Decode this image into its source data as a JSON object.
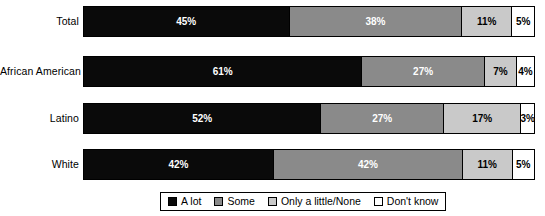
{
  "chart_data": {
    "type": "bar",
    "subtype": "stacked-horizontal-100pct",
    "title": "",
    "xlabel": "",
    "ylabel": "",
    "xlim": [
      0,
      100
    ],
    "grid": false,
    "legend_position": "bottom",
    "categories": [
      "Total",
      "African American",
      "Latino",
      "White"
    ],
    "series": [
      {
        "name": "A lot",
        "color": "#0a0a0a",
        "values": [
          45,
          61,
          52,
          42
        ]
      },
      {
        "name": "Some",
        "color": "#8a8a8a",
        "values": [
          38,
          27,
          27,
          42
        ]
      },
      {
        "name": "Only a little/None",
        "color": "#c9c9c9",
        "values": [
          11,
          7,
          17,
          11
        ]
      },
      {
        "name": "Don't know",
        "color": "#ffffff",
        "values": [
          5,
          4,
          3,
          5
        ]
      }
    ]
  },
  "rows": [
    {
      "label": "Total",
      "segments": [
        {
          "key": "alot",
          "label": "45%",
          "value": 45
        },
        {
          "key": "some",
          "label": "38%",
          "value": 38
        },
        {
          "key": "little",
          "label": "11%",
          "value": 11
        },
        {
          "key": "dk",
          "label": "5%",
          "value": 5
        }
      ]
    },
    {
      "label": "African American",
      "segments": [
        {
          "key": "alot",
          "label": "61%",
          "value": 61
        },
        {
          "key": "some",
          "label": "27%",
          "value": 27
        },
        {
          "key": "little",
          "label": "7%",
          "value": 7
        },
        {
          "key": "dk",
          "label": "4%",
          "value": 4
        }
      ]
    },
    {
      "label": "Latino",
      "segments": [
        {
          "key": "alot",
          "label": "52%",
          "value": 52
        },
        {
          "key": "some",
          "label": "27%",
          "value": 27
        },
        {
          "key": "little",
          "label": "17%",
          "value": 17
        },
        {
          "key": "dk",
          "label": "3%",
          "value": 3
        }
      ]
    },
    {
      "label": "White",
      "segments": [
        {
          "key": "alot",
          "label": "42%",
          "value": 42
        },
        {
          "key": "some",
          "label": "42%",
          "value": 42
        },
        {
          "key": "little",
          "label": "11%",
          "value": 11
        },
        {
          "key": "dk",
          "label": "5%",
          "value": 5
        }
      ]
    }
  ],
  "legend": {
    "items": [
      {
        "key": "alot",
        "label": "A lot",
        "color": "#0a0a0a"
      },
      {
        "key": "some",
        "label": "Some",
        "color": "#8a8a8a"
      },
      {
        "key": "little",
        "label": "Only a little/None",
        "color": "#c9c9c9"
      },
      {
        "key": "dk",
        "label": "Don't know",
        "color": "#ffffff"
      }
    ]
  }
}
